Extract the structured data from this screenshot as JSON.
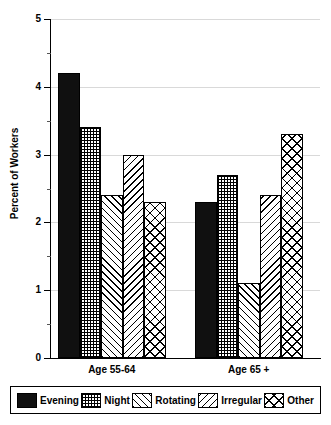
{
  "chart_data": {
    "type": "bar",
    "title": "",
    "xlabel": "",
    "ylabel": "Percent of Workers",
    "ylim": [
      0,
      5
    ],
    "ytick_labels": [
      "0",
      "1",
      "2",
      "3",
      "4",
      "5"
    ],
    "ytick_values": [
      0,
      1,
      2,
      3,
      4,
      5
    ],
    "minor_tick_values": [
      0.5,
      1.5,
      2.5,
      3.5,
      4.5
    ],
    "grid": "horizontal-major",
    "legend_position": "below-plot",
    "categories": [
      "Age 55-64",
      "Age 65 +"
    ],
    "series": [
      {
        "name": "Evening",
        "pattern": "solid",
        "values": [
          4.2,
          2.3
        ]
      },
      {
        "name": "Night",
        "pattern": "checker",
        "values": [
          3.4,
          2.7
        ]
      },
      {
        "name": "Rotating",
        "pattern": "fwd-diagonal",
        "values": [
          2.4,
          1.1
        ]
      },
      {
        "name": "Irregular",
        "pattern": "back-diagonal",
        "values": [
          3.0,
          2.4
        ]
      },
      {
        "name": "Other",
        "pattern": "crosshatch",
        "values": [
          2.3,
          3.3
        ]
      }
    ]
  },
  "axis": {
    "y_title": "Percent of Workers",
    "y_labels": {
      "0": "0",
      "1": "1",
      "2": "2",
      "3": "3",
      "4": "4",
      "5": "5"
    },
    "x_labels": {
      "0": "Age 55-64",
      "1": "Age 65 +"
    }
  },
  "legend": {
    "items": [
      {
        "label": "Evening"
      },
      {
        "label": "Night"
      },
      {
        "label": "Rotating"
      },
      {
        "label": "Irregular"
      },
      {
        "label": "Other"
      }
    ]
  },
  "colors": {
    "axis": "#000000",
    "grid": "#d9d9d9",
    "background": "#ffffff",
    "bar_outline": "#000000",
    "solid_fill": "#101010"
  }
}
